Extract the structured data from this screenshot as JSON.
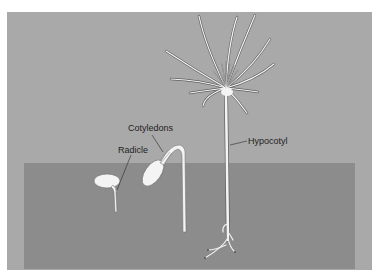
{
  "figure": {
    "colors": {
      "background": "#ffffff",
      "air": "#a9a9a9",
      "soil": "#8c8c8c",
      "plant": "#f4f4f4",
      "plant_outline": "#5a5a5a",
      "label_text": "#1e1e1e"
    },
    "labels": {
      "radicle": "Radicle",
      "cotyledons": "Cotyledons",
      "hypocotyl": "Hypocotyl"
    }
  }
}
